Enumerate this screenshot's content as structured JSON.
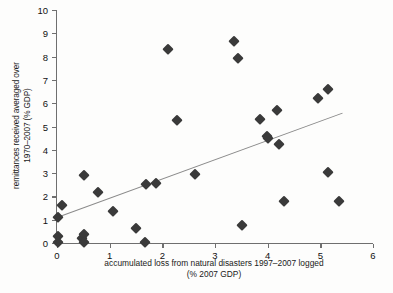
{
  "chart_data": {
    "type": "scatter",
    "title": "",
    "xlabel": "accumulated loss from natural disasters  1997–2007 logged",
    "xlabel_line2": "(% 2007 GDP)",
    "ylabel": "remittances received averaged over",
    "ylabel_line2": "1970–2007 (% GDP)",
    "xlim": [
      0,
      6
    ],
    "ylim": [
      0,
      10
    ],
    "xticks": [
      0,
      1,
      2,
      3,
      4,
      5,
      6
    ],
    "yticks": [
      0,
      1,
      2,
      3,
      4,
      5,
      6,
      7,
      8,
      9,
      10
    ],
    "xticklabels": [
      "0",
      "1",
      "2",
      "3",
      "4",
      "5",
      "6"
    ],
    "yticklabels": [
      "0",
      "1",
      "2",
      "3",
      "4",
      "5",
      "6",
      "7",
      "8",
      "9",
      "10"
    ],
    "grid": false,
    "legend": null,
    "marker": "diamond",
    "marker_color": "#3a3a3a",
    "trendline_color": "#8a8a8a",
    "axis_color": "#6f6f6f",
    "points": [
      {
        "x": 0.02,
        "y": 1.1
      },
      {
        "x": 0.02,
        "y": 0.3
      },
      {
        "x": 0.02,
        "y": 0.04
      },
      {
        "x": 0.09,
        "y": 1.63
      },
      {
        "x": 0.48,
        "y": 0.22
      },
      {
        "x": 0.52,
        "y": 0.37
      },
      {
        "x": 0.52,
        "y": 0.03
      },
      {
        "x": 0.51,
        "y": 2.9
      },
      {
        "x": 0.78,
        "y": 2.18
      },
      {
        "x": 1.06,
        "y": 1.36
      },
      {
        "x": 1.5,
        "y": 0.66
      },
      {
        "x": 1.68,
        "y": 0.05
      },
      {
        "x": 1.69,
        "y": 2.52
      },
      {
        "x": 1.88,
        "y": 2.57
      },
      {
        "x": 2.11,
        "y": 8.33
      },
      {
        "x": 2.28,
        "y": 5.29
      },
      {
        "x": 2.62,
        "y": 2.98
      },
      {
        "x": 3.37,
        "y": 8.68
      },
      {
        "x": 3.43,
        "y": 7.95
      },
      {
        "x": 3.51,
        "y": 0.78
      },
      {
        "x": 3.86,
        "y": 5.31
      },
      {
        "x": 3.98,
        "y": 4.58
      },
      {
        "x": 4.0,
        "y": 4.49
      },
      {
        "x": 4.18,
        "y": 5.69
      },
      {
        "x": 4.21,
        "y": 4.26
      },
      {
        "x": 4.31,
        "y": 1.79
      },
      {
        "x": 4.96,
        "y": 6.23
      },
      {
        "x": 5.14,
        "y": 6.59
      },
      {
        "x": 5.15,
        "y": 3.06
      },
      {
        "x": 5.36,
        "y": 1.8
      }
    ],
    "trendline": {
      "x0": 0.0,
      "y0": 1.1,
      "x1": 5.42,
      "y1": 5.58
    }
  }
}
